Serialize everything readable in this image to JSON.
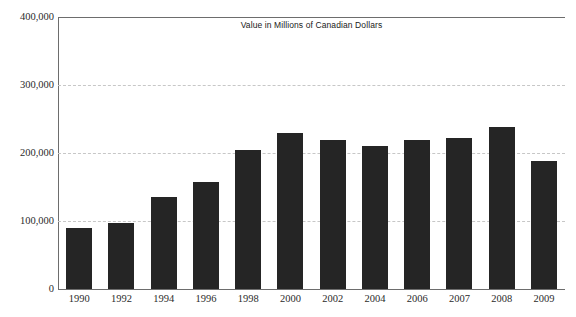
{
  "chart_data": {
    "type": "bar",
    "title": "Value in Millions of Canadian Dollars",
    "xlabel": "",
    "ylabel": "",
    "categories": [
      "1990",
      "1992",
      "1994",
      "1996",
      "1998",
      "2000",
      "2002",
      "2004",
      "2006",
      "2007",
      "2008",
      "2009"
    ],
    "values": [
      89000,
      97000,
      136000,
      157000,
      204000,
      230000,
      219000,
      211000,
      219000,
      222000,
      238000,
      188000
    ],
    "ylim": [
      0,
      400000
    ],
    "ytick_labels": [
      "0",
      "100,000",
      "200,000",
      "300,000",
      "400,000"
    ],
    "ytick_values": [
      0,
      100000,
      200000,
      300000,
      400000
    ],
    "grid": true,
    "grid_axis": "y",
    "legend": false,
    "bar_color": "#252525",
    "grid_color": "#c7c7c7",
    "axis_color": "#6d6d6d",
    "background": "#ffffff"
  }
}
